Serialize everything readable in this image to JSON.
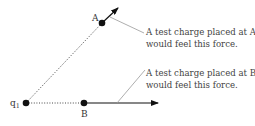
{
  "labels": {
    "charge": "q",
    "charge_subscript": "1",
    "point_a": "A",
    "point_b": "B"
  },
  "annotations": {
    "a": [
      "A test charge placed at A",
      "would feel this force."
    ],
    "b": [
      "A test charge placed at B",
      "would feel this force."
    ]
  },
  "colors": {
    "ink": "#111111",
    "leader": "#999999",
    "text": "#444444"
  }
}
